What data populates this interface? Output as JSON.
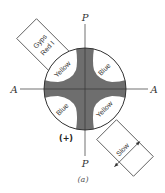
{
  "figure": {
    "caption": "(a)",
    "polarizer_label": "P",
    "analyzer_label": "A",
    "sign": "(+)",
    "quadrants": {
      "top_left": "Yellow",
      "top_right": "Blue",
      "bottom_left": "Blue",
      "bottom_right": "Yellow"
    },
    "plate": {
      "line1": "Gyps",
      "line2": "Red I"
    },
    "slow_box": {
      "label": "Slow"
    },
    "colors": {
      "isogyre": "#6e6e6e",
      "line": "#333333",
      "background": "#ffffff"
    }
  }
}
